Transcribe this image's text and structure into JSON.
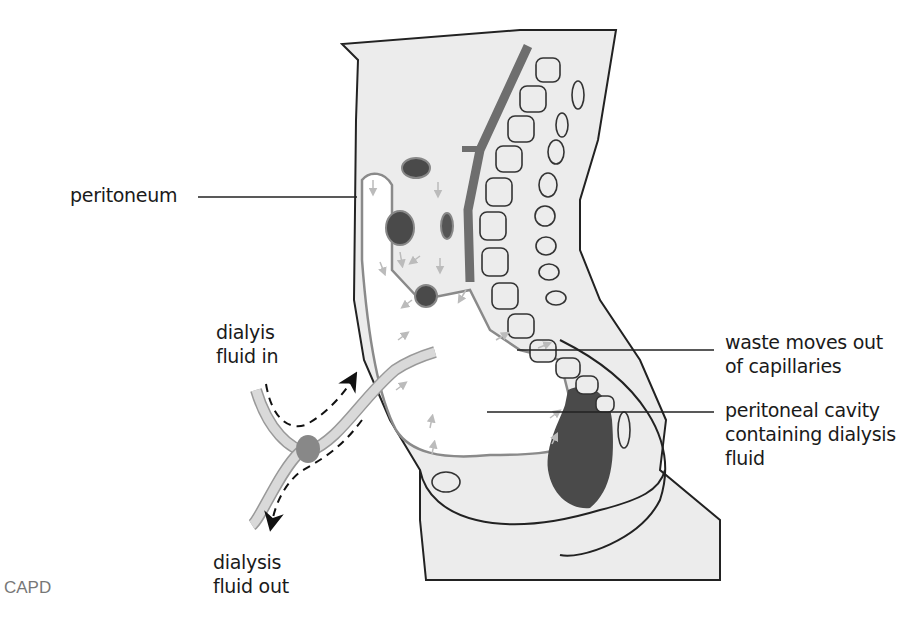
{
  "figure": {
    "caption": "CAPD",
    "colors": {
      "body_fill": "#ececec",
      "outline": "#222222",
      "cavity_fill": "#ffffff",
      "organ_dark": "#4a4a4a",
      "organ_mid": "#707070",
      "aorta": "#6e6e6e",
      "tube_fill": "#d9d9d9",
      "arrow_light": "#bbbbbb",
      "flow_arrow": "#111111"
    }
  },
  "labels": {
    "peritoneum": "peritoneum",
    "fluid_in_line1": "dialyis",
    "fluid_in_line2": "fluid in",
    "fluid_out_line1": "dialysis",
    "fluid_out_line2": "fluid out",
    "waste_line1": "waste moves out",
    "waste_line2": "of capillaries",
    "cavity_line1": "peritoneal cavity",
    "cavity_line2": "containing dialysis",
    "cavity_line3": "fluid"
  }
}
